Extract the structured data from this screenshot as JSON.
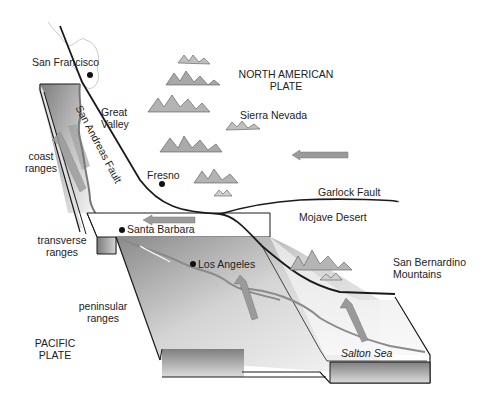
{
  "diagram": {
    "plates": {
      "north_american": {
        "line1": "NORTH AMERICAN",
        "line2": "PLATE"
      },
      "pacific": {
        "line1": "PACIFIC",
        "line2": "PLATE"
      }
    },
    "faults": {
      "san_andreas": "San Andreas Fault",
      "garlock": "Garlock Fault"
    },
    "regions": {
      "great_valley": {
        "line1": "Great",
        "line2": "Valley"
      },
      "sierra_nevada": "Sierra Nevada",
      "mojave_desert": "Mojave Desert",
      "san_bernardino": {
        "line1": "San Bernardino",
        "line2": "Mountains"
      },
      "coast_ranges": {
        "line1": "coast",
        "line2": "ranges"
      },
      "transverse_ranges": {
        "line1": "transverse",
        "line2": "ranges"
      },
      "peninsular_ranges": {
        "line1": "peninsular",
        "line2": "ranges"
      },
      "salton_sea": "Salton Sea"
    },
    "cities": {
      "san_francisco": "San Francisco",
      "fresno": "Fresno",
      "santa_barbara": "Santa Barbara",
      "los_angeles": "Los Angeles"
    },
    "arrows": [
      {
        "name": "north-american-plate-motion",
        "direction": "west"
      },
      {
        "name": "transverse-block-motion",
        "direction": "west"
      },
      {
        "name": "coast-ranges-motion",
        "direction": "northwest"
      },
      {
        "name": "peninsular-motion",
        "direction": "northwest"
      },
      {
        "name": "salton-motion",
        "direction": "northwest"
      }
    ],
    "colors": {
      "line": "#1a1a1a",
      "block_top": "#e6e6e6",
      "block_side_dark": "#8a8a8a",
      "arrow": "#9a9a9a",
      "mountain": "#777777"
    }
  }
}
